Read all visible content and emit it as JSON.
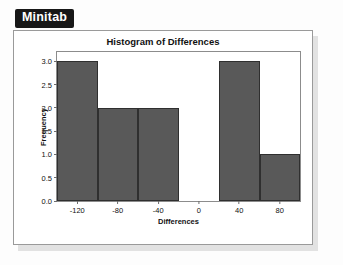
{
  "badge": {
    "label": "Minitab"
  },
  "chart_data": {
    "type": "bar",
    "title": "Histogram of Differences",
    "xlabel": "Differences",
    "ylabel": "Frequency",
    "categories": [
      "-140 to -100",
      "-100 to -60",
      "-60 to -20",
      "-20 to 20",
      "20 to 60",
      "60 to 100"
    ],
    "values": [
      3,
      2,
      2,
      0,
      3,
      1
    ],
    "xticks": [
      "-120",
      "-80",
      "-40",
      "0",
      "40",
      "80"
    ],
    "yticks": [
      "0.0",
      "0.5",
      "1.0",
      "1.5",
      "2.0",
      "2.5",
      "3.0"
    ],
    "ylim": [
      0,
      3.2
    ],
    "xlim": [
      -140,
      100
    ],
    "grid": false,
    "legend": "none",
    "bar_color": "#595959",
    "bar_edge_color": "#2f2f2f"
  }
}
